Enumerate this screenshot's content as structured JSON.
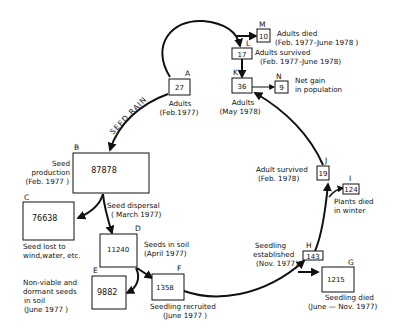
{
  "diagram": {
    "nodes": {
      "A": {
        "letter": "A",
        "value": "27",
        "label": [
          "Adults",
          "(Feb.1977)"
        ]
      },
      "B": {
        "letter": "B",
        "value": "87878",
        "label": [
          "Seed",
          "production",
          "(Feb. 1977 )"
        ]
      },
      "C": {
        "letter": "C",
        "value": "76638",
        "label": [
          "Seed lost to",
          "wind,water, etc."
        ]
      },
      "D": {
        "letter": "D",
        "value": "11240",
        "label": [
          "Seeds in soil",
          "(April 1977)"
        ]
      },
      "E": {
        "letter": "E",
        "value": "9882",
        "label": [
          "Non-viable and",
          "dormant seeds",
          "in soil",
          "(June 1977 )"
        ]
      },
      "F": {
        "letter": "F",
        "value": "1358",
        "label": [
          "Seedling recruited",
          "(June 1977 )"
        ]
      },
      "G": {
        "letter": "G",
        "value": "1215",
        "label": [
          "Seedling died",
          "(June — Nov. 1977)"
        ]
      },
      "H": {
        "letter": "H",
        "value": "143",
        "label": [
          "Seedling",
          "established",
          "(Nov. 1977)"
        ]
      },
      "I": {
        "letter": "I",
        "value": "124",
        "label": [
          "Plants died",
          "in winter"
        ]
      },
      "J": {
        "letter": "J",
        "value": "19",
        "label": [
          "Adult survived",
          "(Feb. 1978)"
        ]
      },
      "K": {
        "letter": "K",
        "value": "36",
        "label": [
          "Adults",
          "(May 1978)"
        ]
      },
      "L": {
        "letter": "L",
        "value": "17",
        "label": [
          "Adults survived",
          "(Feb. 1977–June 1978)"
        ]
      },
      "M": {
        "letter": "M",
        "value": "10",
        "label": [
          "Adults died",
          "(Feb. 1977–June 1978 )"
        ]
      },
      "N": {
        "letter": "N",
        "value": "9",
        "label": [
          "Net gain",
          "in population"
        ]
      }
    },
    "edges": {
      "seed_rain": "SEED RAIN",
      "seed_dispersal": [
        "Seed dispersal",
        "( March 1977)"
      ]
    },
    "colors": {
      "ink": "#111111",
      "background": "#ffffff"
    }
  }
}
